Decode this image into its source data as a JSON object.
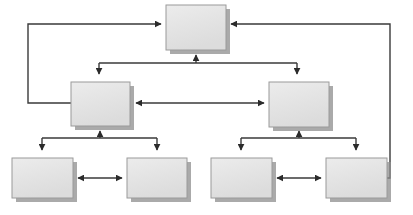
{
  "diagram": {
    "type": "tree-with-feedback",
    "canvas": {
      "width": 413,
      "height": 215,
      "background": "#ffffff"
    },
    "style": {
      "box_fill": "#e4e4e4",
      "box_fill_top": "#ebebeb",
      "box_border": "#9a9a9a",
      "box_shadow": "#8e8e8e",
      "line_color": "#3a3a3a",
      "line_width": 1.4,
      "arrow_color": "#2b2b2b",
      "shadow_offset_px": 4
    },
    "nodes": [
      {
        "id": "root",
        "label": "",
        "level": 1,
        "x": 166,
        "y": 5,
        "w": 60,
        "h": 45
      },
      {
        "id": "left-branch",
        "label": "",
        "level": 2,
        "x": 71,
        "y": 82,
        "w": 59,
        "h": 44
      },
      {
        "id": "right-branch",
        "label": "",
        "level": 2,
        "x": 269,
        "y": 82,
        "w": 60,
        "h": 45
      },
      {
        "id": "leaf-1",
        "label": "",
        "level": 3,
        "x": 12,
        "y": 158,
        "w": 61,
        "h": 40
      },
      {
        "id": "leaf-2",
        "label": "",
        "level": 3,
        "x": 127,
        "y": 158,
        "w": 60,
        "h": 40
      },
      {
        "id": "leaf-3",
        "label": "",
        "level": 3,
        "x": 211,
        "y": 158,
        "w": 61,
        "h": 40
      },
      {
        "id": "leaf-4",
        "label": "",
        "level": 3,
        "x": 326,
        "y": 158,
        "w": 61,
        "h": 40
      }
    ],
    "edges": [
      {
        "id": "edge-root-to-left-branch",
        "from": "root",
        "to": "left-branch",
        "kind": "branch-down",
        "arrow": "end"
      },
      {
        "id": "edge-root-to-right-branch",
        "from": "root",
        "to": "right-branch",
        "kind": "branch-down",
        "arrow": "end"
      },
      {
        "id": "edge-branchbar-to-root",
        "from": "branch-bar",
        "to": "root",
        "kind": "up",
        "arrow": "end"
      },
      {
        "id": "edge-left-branch-to-leaf-1",
        "from": "left-branch",
        "to": "leaf-1",
        "kind": "branch-down",
        "arrow": "end"
      },
      {
        "id": "edge-left-branch-to-leaf-2",
        "from": "left-branch",
        "to": "leaf-2",
        "kind": "branch-down",
        "arrow": "end"
      },
      {
        "id": "edge-leftbar-to-left-branch",
        "from": "left-bar",
        "to": "left-branch",
        "kind": "up",
        "arrow": "end"
      },
      {
        "id": "edge-right-branch-to-leaf-3",
        "from": "right-branch",
        "to": "leaf-3",
        "kind": "branch-down",
        "arrow": "end"
      },
      {
        "id": "edge-right-branch-to-leaf-4",
        "from": "right-branch",
        "to": "leaf-4",
        "kind": "branch-down",
        "arrow": "end"
      },
      {
        "id": "edge-rightbar-to-right-branch",
        "from": "right-bar",
        "to": "right-branch",
        "kind": "up",
        "arrow": "end"
      },
      {
        "id": "edge-left-branch-right-branch",
        "from": "left-branch",
        "to": "right-branch",
        "kind": "horizontal",
        "arrow": "both"
      },
      {
        "id": "edge-leaf-1-leaf-2",
        "from": "leaf-1",
        "to": "leaf-2",
        "kind": "horizontal",
        "arrow": "both"
      },
      {
        "id": "edge-leaf-3-leaf-4",
        "from": "leaf-3",
        "to": "leaf-4",
        "kind": "horizontal",
        "arrow": "both"
      },
      {
        "id": "edge-left-feedback",
        "from": "left-branch",
        "to": "root",
        "kind": "feedback-left",
        "arrow": "end"
      },
      {
        "id": "edge-right-feedback",
        "from": "leaf-4",
        "to": "root",
        "kind": "feedback-right",
        "arrow": "end"
      }
    ],
    "geometry": {
      "branch_bar_y": 63,
      "branch_bar_x1": 99,
      "branch_bar_x2": 297,
      "branch_bar_center_x": 196,
      "left_bar_y": 138,
      "left_bar_x1": 42,
      "left_bar_x2": 157,
      "left_bar_center_x": 100,
      "right_bar_y": 138,
      "right_bar_x1": 241,
      "right_bar_x2": 356,
      "right_bar_center_x": 299,
      "left_feedback_x": 28,
      "left_feedback_y_top": 24,
      "left_feedback_y_bottom": 103,
      "right_feedback_x": 390,
      "right_feedback_y_top": 24,
      "right_feedback_y_bottom": 178,
      "mid_link_y": 103,
      "leaf_link_y": 178
    }
  }
}
